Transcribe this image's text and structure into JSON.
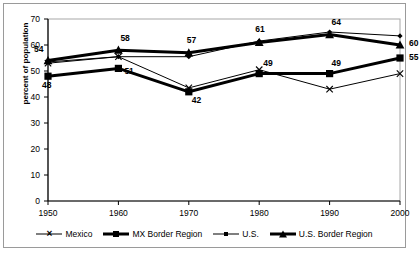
{
  "chart_data": {
    "type": "line",
    "title": "",
    "xlabel": "",
    "ylabel": "percent of population",
    "categories": [
      1950,
      1960,
      1970,
      1980,
      1990,
      2000
    ],
    "xtick_labels": [
      "1950",
      "1960",
      "1970",
      "1980",
      "1990",
      "2000"
    ],
    "ytick_labels": [
      "0",
      "10",
      "20",
      "30",
      "40",
      "50",
      "60",
      "70"
    ],
    "ylim": [
      0,
      70
    ],
    "ytick_step": 10,
    "xlim": [
      1950,
      2000
    ],
    "grid": false,
    "legend_position": "bottom",
    "series": [
      {
        "name": "Mexico",
        "marker": "x",
        "line": "thin",
        "color": "#000000",
        "values": [
          53,
          55.5,
          43.5,
          50.5,
          43,
          49
        ],
        "labels": [
          "",
          "",
          "",
          "",
          "",
          ""
        ]
      },
      {
        "name": "MX Border Region",
        "marker": "square",
        "line": "thick",
        "color": "#000000",
        "values": [
          48,
          51,
          42,
          49,
          49,
          55
        ],
        "labels": [
          "48",
          "51",
          "42",
          "49",
          "49",
          "55"
        ]
      },
      {
        "name": "U.S.",
        "marker": "diamond",
        "line": "thin",
        "color": "#000000",
        "values": [
          53.5,
          55.5,
          55.5,
          61.5,
          65,
          63.5
        ],
        "labels": [
          "",
          "",
          "",
          "",
          "",
          ""
        ]
      },
      {
        "name": "U.S. Border Region",
        "marker": "triangle",
        "line": "thick",
        "color": "#000000",
        "values": [
          54,
          58,
          57,
          61,
          64,
          60
        ],
        "labels": [
          "54",
          "58",
          "57",
          "61",
          "64",
          "60"
        ]
      }
    ],
    "annotations": [
      {
        "text": "54",
        "x": 1950,
        "y": 54
      },
      {
        "text": "48",
        "x": 1950,
        "y": 48
      },
      {
        "text": "58",
        "x": 1960,
        "y": 58
      },
      {
        "text": "51",
        "x": 1960,
        "y": 51
      },
      {
        "text": "57",
        "x": 1970,
        "y": 57
      },
      {
        "text": "42",
        "x": 1970,
        "y": 42
      },
      {
        "text": "61",
        "x": 1980,
        "y": 61
      },
      {
        "text": "49",
        "x": 1980,
        "y": 49
      },
      {
        "text": "64",
        "x": 1990,
        "y": 64
      },
      {
        "text": "49",
        "x": 1990,
        "y": 49
      },
      {
        "text": "60",
        "x": 2000,
        "y": 60
      },
      {
        "text": "55",
        "x": 2000,
        "y": 55
      }
    ]
  },
  "legend": {
    "items": [
      {
        "label": "Mexico",
        "marker": "x-marker",
        "line": "thin"
      },
      {
        "label": "MX Border Region",
        "marker": "square-marker",
        "line": "thick"
      },
      {
        "label": "U.S.",
        "marker": "diamond-marker",
        "line": "thin"
      },
      {
        "label": "U.S. Border Region",
        "marker": "triangle-marker",
        "line": "thick"
      }
    ]
  }
}
